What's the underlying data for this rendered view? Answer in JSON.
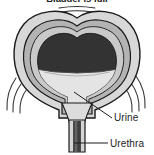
{
  "figure": {
    "title": "Bladder is full",
    "labels": {
      "urine": "Urine",
      "urethra": "Urethra"
    },
    "icon_names": {
      "bladder": "bladder-icon",
      "urine_fill": "urine-fill-icon",
      "urethra_tube": "urethra-tube-icon",
      "motion_lines": "motion-lines-icon"
    },
    "colors": {
      "outline": "#1a1a1a",
      "outer_wall": "#d8d8d8",
      "muscle_wall": "#b3b3b3",
      "inner_cavity": "#333333",
      "urine": "#e4e4e4",
      "urethra_dark": "#4a4a4a",
      "background": "#ffffff",
      "leader_line": "#1c1c1c"
    }
  }
}
